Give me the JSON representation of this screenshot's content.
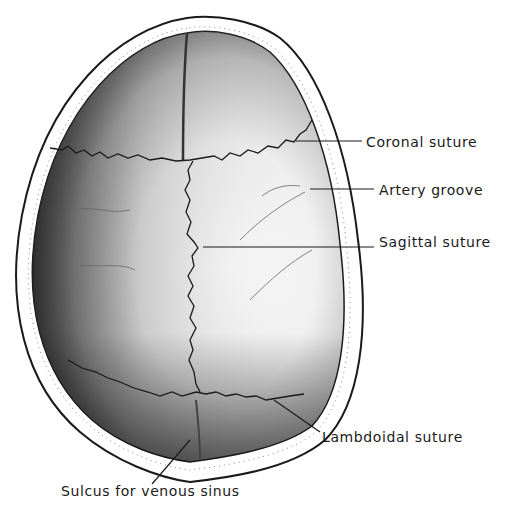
{
  "figure": {
    "labels": {
      "coronal_suture": "Coronal suture",
      "artery_groove": "Artery groove",
      "sagittal_suture": "Sagittal suture",
      "lambdoidal_suture": "Lambdoidal suture",
      "sulcus_venous_sinus": "Sulcus for venous sinus"
    },
    "colors": {
      "outline": "#1a1a1a",
      "bone_light": "#f4f4f4",
      "bone_shadow": "#5a5a5a",
      "background": "#ffffff"
    }
  }
}
